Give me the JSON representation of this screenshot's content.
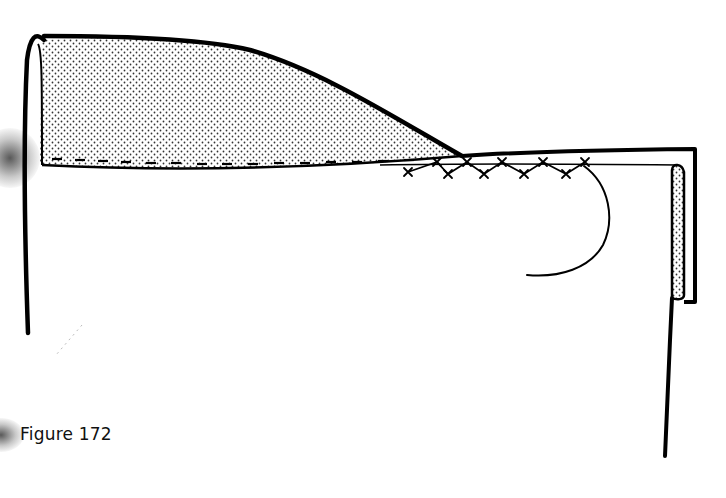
{
  "figure": {
    "caption": "Figure 172",
    "colors": {
      "ink": "#000000",
      "paper": "#ffffff",
      "dot_fill": "#333333"
    },
    "elements": [
      {
        "name": "folded-fabric-flap",
        "pattern": "stippled"
      },
      {
        "name": "running-stitch-line",
        "style": "dashed"
      },
      {
        "name": "catch-stitch-row",
        "style": "cross-stitch zigzag"
      },
      {
        "name": "thread-tail",
        "style": "curved line"
      },
      {
        "name": "folded-right-edge",
        "pattern": "stippled"
      }
    ]
  }
}
